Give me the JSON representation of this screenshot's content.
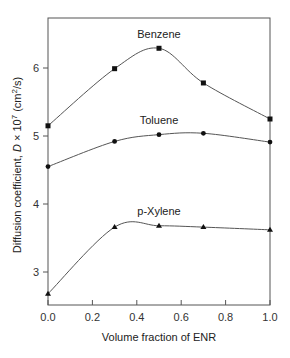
{
  "chart_data": {
    "type": "line",
    "title": "",
    "xlabel": "Volume fraction of ENR",
    "ylabel": "Diffusion coefficient, D × 10⁷ (cm²/s)",
    "ylabel_parts": {
      "prefix": "Diffusion coefficient, ",
      "var": "D",
      "mid": " × 10",
      "exp7": "7",
      "unit_open": " (cm",
      "exp2": "2",
      "unit_close": "/s)"
    },
    "xlim": [
      0.0,
      1.0
    ],
    "ylim": [
      2.5,
      6.75
    ],
    "xticks": [
      "0.0",
      "0.2",
      "0.4",
      "0.6",
      "0.8",
      "1.0"
    ],
    "yticks": [
      "3",
      "4",
      "5",
      "6"
    ],
    "grid": false,
    "legend": "inline labels above each curve",
    "x": [
      0.0,
      0.3,
      0.5,
      0.7,
      1.0
    ],
    "series": [
      {
        "name": "Benzene",
        "marker": "square",
        "values": [
          5.15,
          5.99,
          6.29,
          5.78,
          5.25
        ]
      },
      {
        "name": "Toluene",
        "marker": "circle",
        "values": [
          4.55,
          4.92,
          5.02,
          5.04,
          4.91
        ]
      },
      {
        "name": "p-Xylene",
        "marker": "triangle",
        "values": [
          2.68,
          3.66,
          3.68,
          3.66,
          3.62
        ]
      }
    ]
  },
  "colors": {
    "line": "#555555",
    "marker": "#111111",
    "axis": "#444444"
  }
}
